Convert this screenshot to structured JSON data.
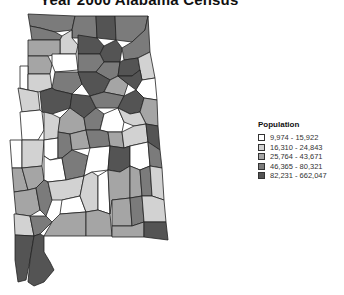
{
  "title": "Year 2000 Alabama Census",
  "legend": {
    "title": "Population",
    "classes": [
      {
        "label": "9,974 - 15,922",
        "color": "#ffffff"
      },
      {
        "label": "16,310 - 24,843",
        "color": "#d2d2d2"
      },
      {
        "label": "25,764 - 43,671",
        "color": "#a5a5a5"
      },
      {
        "label": "46,365 - 80,321",
        "color": "#7b7b7b"
      },
      {
        "label": "82,231 - 662,047",
        "color": "#545454"
      }
    ]
  },
  "map": {
    "region": "Alabama",
    "unit": "county",
    "outline_color": "#222222"
  }
}
